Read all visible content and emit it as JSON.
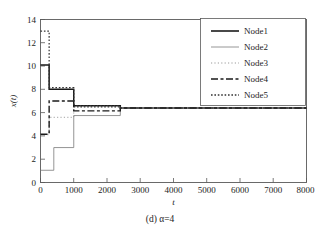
{
  "chart_data": {
    "type": "line",
    "title": "",
    "caption": "(d) α=4",
    "xlabel": "t",
    "ylabel": "x(t)",
    "xlim": [
      0,
      8000
    ],
    "ylim": [
      0,
      14
    ],
    "xticks": [
      0,
      1000,
      2000,
      3000,
      4000,
      5000,
      6000,
      7000,
      8000
    ],
    "xtick_labels": [
      "0",
      "1000",
      "2000",
      "3000",
      "4000",
      "5000",
      "6000",
      "7000",
      "8000"
    ],
    "yticks": [
      0,
      2,
      4,
      6,
      8,
      10,
      12,
      14
    ],
    "ytick_labels": [
      "0",
      "2",
      "4",
      "6",
      "8",
      "10",
      "12",
      "14"
    ],
    "grid": false,
    "legend_position": "upper right",
    "legend_entries": [
      "Node1",
      "Node2",
      "Node3",
      "Node4",
      "Node5"
    ],
    "converged_value": 6.4,
    "convergence_time": 2400,
    "series": [
      {
        "name": "Node1",
        "style": "solid",
        "width": 1.5,
        "color": "#1a1a1a",
        "x": [
          0,
          260,
          260,
          1000,
          1000,
          2400,
          2400,
          8000
        ],
        "values": [
          10.1,
          10.1,
          8.0,
          8.0,
          6.6,
          6.6,
          6.4,
          6.4
        ]
      },
      {
        "name": "Node2",
        "style": "solid",
        "width": 0.8,
        "color": "#7a7a7a",
        "x": [
          0,
          400,
          400,
          1000,
          1000,
          2400,
          2400,
          8000
        ],
        "values": [
          1.05,
          1.05,
          3.0,
          3.0,
          5.75,
          5.75,
          6.4,
          6.4
        ]
      },
      {
        "name": "Node3",
        "style": "dotted-fine",
        "width": 0.8,
        "color": "#8a8a8a",
        "x": [
          0,
          260,
          260,
          1000,
          1000,
          2400,
          2400,
          8000
        ],
        "values": [
          4.1,
          4.1,
          5.6,
          5.6,
          6.55,
          6.55,
          6.4,
          6.4
        ]
      },
      {
        "name": "Node4",
        "style": "dash-dot",
        "width": 1.4,
        "color": "#1a1a1a",
        "x": [
          0,
          260,
          260,
          1000,
          1000,
          2400,
          2400,
          8000
        ],
        "values": [
          4.15,
          4.15,
          7.0,
          7.0,
          6.15,
          6.15,
          6.4,
          6.4
        ]
      },
      {
        "name": "Node5",
        "style": "dotted",
        "width": 1.2,
        "color": "#333333",
        "x": [
          0,
          260,
          260,
          1000,
          1000,
          2400,
          2400,
          8000
        ],
        "values": [
          13.0,
          13.0,
          8.15,
          8.15,
          6.5,
          6.5,
          6.4,
          6.4
        ]
      }
    ]
  },
  "axes": {
    "x_axis_label": "t",
    "y_axis_label": "x(t)"
  },
  "legend": {
    "items": [
      {
        "label": "Node1"
      },
      {
        "label": "Node2"
      },
      {
        "label": "Node3"
      },
      {
        "label": "Node4"
      },
      {
        "label": "Node5"
      }
    ]
  },
  "caption": {
    "text": "(d) α=4"
  }
}
